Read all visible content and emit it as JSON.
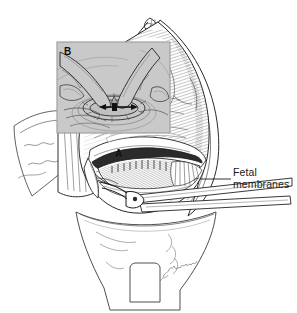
{
  "figure": {
    "background_color": "#ffffff",
    "ink_color": "#1f1f1f",
    "inset_background_color": "#c9c9c9",
    "width": 297,
    "height": 313
  },
  "labels": {
    "fetal_membranes_line1": "Fetal",
    "fetal_membranes_line2": "membranes",
    "panel_a": "A",
    "panel_b": "B"
  },
  "leader_lines": [
    {
      "name": "fetal-membranes-leader",
      "from_x": 200,
      "from_y": 179,
      "to_x": 231,
      "to_y": 179
    }
  ],
  "inset_panel": {
    "letter": "B",
    "x": 57,
    "y": 42,
    "width": 113,
    "height": 91,
    "description": "Two gloved fingers inserted into the uterine incision, spreading it bluntly outward",
    "arrow": {
      "name": "bidirectional-expansion-arrow",
      "x1": 101,
      "y1": 107,
      "x2": 136,
      "y2": 107,
      "double_headed": true
    }
  },
  "main_panel": {
    "letter": "A",
    "description": "Abdominal incision retracted to expose the gravid uterus with lower uterine segment incision, fetal membranes bulging, and a surgical instrument entering the incision"
  },
  "signature": {
    "present": true,
    "style": "cursive artist signature",
    "x": 168,
    "y": 268
  },
  "structures": [
    "abdominal wall incision",
    "rectus fascia",
    "parietal peritoneum",
    "gravid uterus",
    "lower uterine segment incision",
    "fetal membranes",
    "bladder flap",
    "surgical forceps",
    "surgical drape"
  ]
}
